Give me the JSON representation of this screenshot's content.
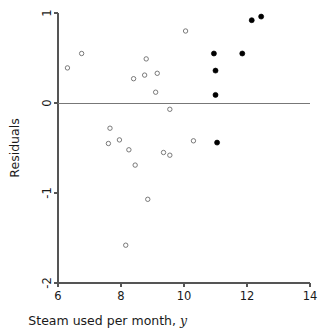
{
  "chart_data": {
    "type": "scatter",
    "title": "",
    "xlabel": "Steam used per month, y",
    "xlabel_plain": "Steam used per month,",
    "xlabel_italic": "y",
    "ylabel": "Residuals",
    "xlim": [
      6,
      14
    ],
    "ylim": [
      -2,
      1
    ],
    "xticks": [
      6,
      8,
      10,
      12,
      14
    ],
    "xtick_labels": [
      "6",
      "8",
      "10",
      "12",
      "14"
    ],
    "yticks": [
      1,
      0,
      -1,
      -2
    ],
    "ytick_labels": [
      "1",
      "0",
      "-1",
      "-2"
    ],
    "grid": false,
    "legend": null,
    "annotations": [
      {
        "type": "reference-line",
        "orientation": "horizontal",
        "value": 0
      }
    ],
    "series": [
      {
        "name": "open-circle-residuals",
        "marker": "open-circle",
        "color": "#6b6b6b",
        "points": [
          {
            "x": 6.3,
            "y": 0.39
          },
          {
            "x": 6.75,
            "y": 0.55
          },
          {
            "x": 7.65,
            "y": -0.28
          },
          {
            "x": 7.6,
            "y": -0.45
          },
          {
            "x": 7.95,
            "y": -0.41
          },
          {
            "x": 8.15,
            "y": -1.58
          },
          {
            "x": 8.25,
            "y": -0.52
          },
          {
            "x": 8.4,
            "y": 0.27
          },
          {
            "x": 8.45,
            "y": -0.69
          },
          {
            "x": 8.75,
            "y": 0.31
          },
          {
            "x": 8.8,
            "y": 0.49
          },
          {
            "x": 8.85,
            "y": -1.07
          },
          {
            "x": 9.1,
            "y": 0.12
          },
          {
            "x": 9.15,
            "y": 0.33
          },
          {
            "x": 9.35,
            "y": -0.55
          },
          {
            "x": 9.55,
            "y": -0.58
          },
          {
            "x": 9.55,
            "y": -0.07
          },
          {
            "x": 10.05,
            "y": 0.8
          },
          {
            "x": 10.3,
            "y": -0.42
          }
        ]
      },
      {
        "name": "filled-circle-residuals",
        "marker": "filled-circle",
        "color": "#000000",
        "points": [
          {
            "x": 10.95,
            "y": 0.55
          },
          {
            "x": 11.0,
            "y": 0.36
          },
          {
            "x": 11.0,
            "y": 0.09
          },
          {
            "x": 11.05,
            "y": -0.44
          },
          {
            "x": 11.85,
            "y": 0.55
          },
          {
            "x": 12.15,
            "y": 0.92
          },
          {
            "x": 12.45,
            "y": 0.96
          }
        ]
      }
    ]
  },
  "colors": {
    "axis": "#555555",
    "zero_line": "#777777",
    "open_marker_stroke": "#6b6b6b",
    "filled_marker": "#000000",
    "background": "#ffffff",
    "text": "#1a1a1a"
  }
}
